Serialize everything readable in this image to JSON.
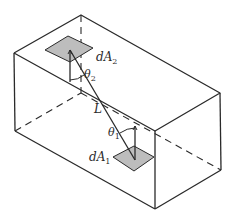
{
  "figure": {
    "type": "isometric box with two differential surface elements",
    "labels": {
      "dA2": {
        "main": "dA",
        "sub": "2"
      },
      "dA1": {
        "main": "dA",
        "sub": "1"
      },
      "theta2": {
        "main": "θ",
        "sub": "2"
      },
      "theta1": {
        "main": "θ",
        "sub": "1"
      },
      "L": "L"
    },
    "colors": {
      "line": "#2a2a2a",
      "patch_fill": "#bdbdbd",
      "background": "#ffffff"
    }
  }
}
